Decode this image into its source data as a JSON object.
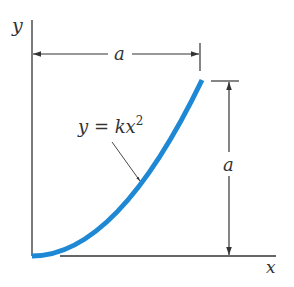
{
  "diagram": {
    "axis_labels": {
      "x": "x",
      "y": "y"
    },
    "equation": {
      "lhs": "y",
      "eq": " = ",
      "rhs": "kx",
      "exponent": "2"
    },
    "dimensions": {
      "horizontal": {
        "label": "a"
      },
      "vertical": {
        "label": "a"
      }
    },
    "colors": {
      "curve": "#1e88d4",
      "lines": "#333333"
    }
  }
}
